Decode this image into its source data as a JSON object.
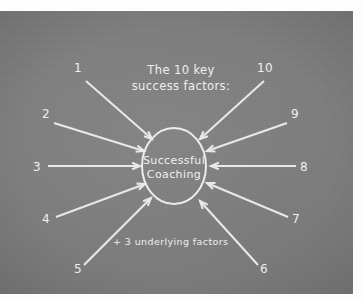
{
  "diagram": {
    "title_line1": "The 10 key",
    "title_line2": "success factors:",
    "center_line1": "Successful",
    "center_line2": "Coaching",
    "note": "+ 3 underlying factors",
    "colors": {
      "board_background": "#7b7b7b",
      "ink": "#ececec",
      "frame": "#fdfdfd"
    },
    "arrows": [
      {
        "label": "1",
        "label_x": 78,
        "label_y": 61,
        "x1": 86,
        "y1": 70,
        "x2": 152,
        "y2": 128
      },
      {
        "label": "2",
        "label_x": 46,
        "label_y": 107,
        "x1": 54,
        "y1": 112,
        "x2": 144,
        "y2": 140
      },
      {
        "label": "3",
        "label_x": 37,
        "label_y": 160,
        "x1": 48,
        "y1": 155,
        "x2": 140,
        "y2": 155
      },
      {
        "label": "4",
        "label_x": 46,
        "label_y": 212,
        "x1": 56,
        "y1": 206,
        "x2": 145,
        "y2": 173
      },
      {
        "label": "5",
        "label_x": 78,
        "label_y": 262,
        "x1": 84,
        "y1": 254,
        "x2": 151,
        "y2": 187
      },
      {
        "label": "6",
        "label_x": 264,
        "label_y": 262,
        "x1": 258,
        "y1": 254,
        "x2": 200,
        "y2": 190
      },
      {
        "label": "7",
        "label_x": 296,
        "label_y": 212,
        "x1": 288,
        "y1": 206,
        "x2": 207,
        "y2": 172
      },
      {
        "label": "8",
        "label_x": 304,
        "label_y": 160,
        "x1": 296,
        "y1": 155,
        "x2": 211,
        "y2": 155
      },
      {
        "label": "9",
        "label_x": 295,
        "label_y": 107,
        "x1": 287,
        "y1": 112,
        "x2": 207,
        "y2": 140
      },
      {
        "label": "10",
        "label_x": 265,
        "label_y": 61,
        "x1": 264,
        "y1": 70,
        "x2": 200,
        "y2": 128
      }
    ],
    "center_shape": {
      "cx": 174,
      "cy": 155,
      "rx": 32,
      "ry": 38
    },
    "title_position": {
      "x": 181,
      "line1_y": 63,
      "line2_y": 79
    },
    "note_position": {
      "x": 113,
      "y": 234
    }
  }
}
